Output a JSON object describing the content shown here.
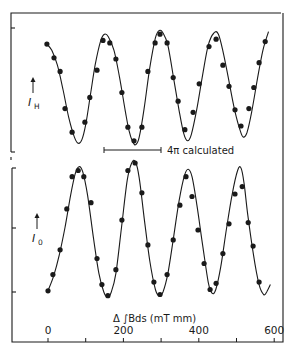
{
  "chart_data": {
    "type": "line",
    "layout": "two vertically stacked panels sharing x-axis",
    "xlabel": "Δ ∫Bds (mT mm)",
    "x_ticks": [
      0,
      200,
      400,
      600
    ],
    "x_minor_ticks": [
      100,
      300,
      500
    ],
    "xlim": [
      -10,
      620
    ],
    "grid": false,
    "legend": null,
    "annotation": {
      "text": "4π calculated",
      "type": "scale-bar",
      "x_start": 148,
      "x_end": 300,
      "panel": "top"
    },
    "colors": {
      "ink": "#1a1a1a",
      "background": "#ffffff"
    },
    "panels": [
      {
        "id": "top",
        "ylabel": "I_H",
        "ylabel_main": "I",
        "ylabel_sub": "H",
        "y_units": "arbitrary (normalized)",
        "ylim": [
          0,
          1
        ],
        "series": [
          {
            "name": "measured",
            "style": "points",
            "x": [
              -3,
              16,
              32,
              45,
              64,
              98,
              111,
              130,
              146,
              164,
              180,
              196,
              212,
              228,
              249,
              265,
              284,
              297,
              316,
              332,
              345,
              363,
              385,
              401,
              427,
              446,
              464,
              480,
              496,
              512,
              533,
              546,
              560,
              576
            ],
            "y": [
              0.87,
              0.76,
              0.65,
              0.35,
              0.16,
              0.24,
              0.44,
              0.66,
              0.9,
              0.88,
              0.75,
              0.48,
              0.2,
              0.09,
              0.2,
              0.65,
              0.88,
              0.95,
              0.88,
              0.6,
              0.41,
              0.18,
              0.32,
              0.55,
              0.85,
              0.91,
              0.7,
              0.53,
              0.34,
              0.21,
              0.35,
              0.52,
              0.72,
              0.89
            ]
          },
          {
            "name": "fit",
            "style": "line",
            "x": [
              -3,
              10,
              25,
              40,
              55,
              70,
              80,
              90,
              100,
              112,
              125,
              140,
              150,
              160,
              175,
              190,
              205,
              215,
              225,
              233,
              242,
              255,
              270,
              285,
              295,
              305,
              318,
              333,
              348,
              360,
              370,
              380,
              395,
              410,
              425,
              440,
              452,
              465,
              480,
              495,
              510,
              518,
              528,
              540,
              555,
              570,
              585
            ],
            "y": [
              0.87,
              0.82,
              0.7,
              0.5,
              0.28,
              0.12,
              0.07,
              0.1,
              0.22,
              0.45,
              0.7,
              0.9,
              0.95,
              0.93,
              0.82,
              0.6,
              0.33,
              0.17,
              0.08,
              0.06,
              0.12,
              0.35,
              0.68,
              0.92,
              0.98,
              0.96,
              0.86,
              0.6,
              0.33,
              0.15,
              0.09,
              0.14,
              0.35,
              0.62,
              0.86,
              0.96,
              0.95,
              0.8,
              0.57,
              0.34,
              0.17,
              0.12,
              0.16,
              0.32,
              0.58,
              0.82,
              0.97
            ]
          }
        ]
      },
      {
        "id": "bottom",
        "ylabel": "I_0",
        "ylabel_main": "I",
        "ylabel_sub": "0",
        "y_units": "arbitrary (normalized)",
        "ylim": [
          0,
          1
        ],
        "series": [
          {
            "name": "measured",
            "style": "points",
            "x": [
              0,
              13,
              32,
              50,
              64,
              80,
              95,
              114,
              130,
              143,
              159,
              180,
              196,
              212,
              231,
              249,
              265,
              281,
              297,
              316,
              332,
              350,
              366,
              382,
              398,
              414,
              430,
              446,
              464,
              480,
              496,
              515,
              531,
              544,
              560
            ],
            "y": [
              0.01,
              0.14,
              0.34,
              0.67,
              0.93,
              0.98,
              0.93,
              0.72,
              0.27,
              0.06,
              -0.03,
              0.18,
              0.58,
              0.98,
              1.04,
              0.8,
              0.38,
              0.08,
              -0.02,
              0.14,
              0.42,
              0.7,
              0.93,
              0.77,
              0.5,
              0.23,
              0.02,
              0.07,
              0.31,
              0.55,
              0.79,
              0.85,
              0.56,
              0.37,
              0.08
            ]
          },
          {
            "name": "fit",
            "style": "line",
            "x": [
              0,
              15,
              30,
              45,
              60,
              72,
              82,
              92,
              105,
              120,
              135,
              148,
              158,
              168,
              180,
              195,
              210,
              222,
              232,
              242,
              255,
              270,
              285,
              295,
              305,
              318,
              332,
              348,
              362,
              372,
              382,
              395,
              410,
              425,
              435,
              445,
              458,
              472,
              488,
              503,
              512,
              520,
              530,
              545,
              560,
              572,
              580,
              590
            ],
            "y": [
              0.01,
              0.13,
              0.3,
              0.52,
              0.78,
              0.95,
              1.01,
              0.97,
              0.78,
              0.45,
              0.15,
              0.0,
              -0.04,
              0.0,
              0.15,
              0.52,
              0.9,
              1.04,
              1.05,
              0.92,
              0.6,
              0.25,
              0.02,
              -0.03,
              0.0,
              0.15,
              0.42,
              0.74,
              0.94,
              0.99,
              0.93,
              0.7,
              0.38,
              0.08,
              -0.01,
              0.02,
              0.2,
              0.48,
              0.78,
              0.98,
              1.0,
              0.88,
              0.62,
              0.3,
              0.06,
              -0.02,
              0.0,
              0.06
            ]
          }
        ]
      }
    ]
  }
}
